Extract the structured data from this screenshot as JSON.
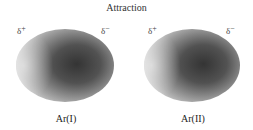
{
  "diagram": {
    "title": "Attraction",
    "atoms": [
      {
        "label": "Ar(I)",
        "positive_pole": "δ",
        "positive_sign": "+",
        "negative_pole": "δ",
        "negative_sign": "−"
      },
      {
        "label": "Ar(II)",
        "positive_pole": "δ",
        "positive_sign": "+",
        "negative_pole": "δ",
        "negative_sign": "−"
      }
    ],
    "colors": {
      "dense_region": "#3a3a3a",
      "sparse_region": "#e0e0e0",
      "background": "#ffffff"
    }
  }
}
